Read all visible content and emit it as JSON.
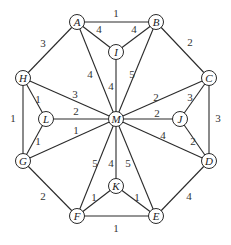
{
  "graph": {
    "nodes": [
      {
        "id": "A",
        "x": 77,
        "y": 22
      },
      {
        "id": "B",
        "x": 156,
        "y": 22
      },
      {
        "id": "C",
        "x": 209,
        "y": 78
      },
      {
        "id": "D",
        "x": 209,
        "y": 161
      },
      {
        "id": "E",
        "x": 156,
        "y": 216
      },
      {
        "id": "F",
        "x": 77,
        "y": 216
      },
      {
        "id": "G",
        "x": 23,
        "y": 161
      },
      {
        "id": "H",
        "x": 23,
        "y": 78
      },
      {
        "id": "I",
        "x": 116,
        "y": 52
      },
      {
        "id": "J",
        "x": 180,
        "y": 119
      },
      {
        "id": "K",
        "x": 116,
        "y": 186
      },
      {
        "id": "L",
        "x": 46,
        "y": 119
      },
      {
        "id": "M",
        "x": 116,
        "y": 119
      }
    ],
    "edges": [
      {
        "from": "A",
        "to": "B",
        "weight": "1",
        "lx": 116,
        "ly": 17
      },
      {
        "from": "B",
        "to": "C",
        "weight": "2",
        "lx": 190,
        "ly": 46
      },
      {
        "from": "C",
        "to": "D",
        "weight": "3",
        "lx": 218,
        "ly": 122
      },
      {
        "from": "D",
        "to": "E",
        "weight": "4",
        "lx": 189,
        "ly": 200
      },
      {
        "from": "E",
        "to": "F",
        "weight": "1",
        "lx": 116,
        "ly": 232
      },
      {
        "from": "F",
        "to": "G",
        "weight": "2",
        "lx": 43,
        "ly": 200
      },
      {
        "from": "G",
        "to": "H",
        "weight": "1",
        "lx": 13,
        "ly": 122
      },
      {
        "from": "H",
        "to": "A",
        "weight": "3",
        "lx": 43,
        "ly": 47
      },
      {
        "from": "A",
        "to": "I",
        "weight": "4",
        "lx": 99,
        "ly": 33
      },
      {
        "from": "B",
        "to": "I",
        "weight": "4",
        "lx": 134,
        "ly": 33
      },
      {
        "from": "I",
        "to": "M",
        "weight": "4",
        "lx": 111,
        "ly": 90
      },
      {
        "from": "A",
        "to": "M",
        "weight": "4",
        "lx": 90,
        "ly": 78
      },
      {
        "from": "B",
        "to": "M",
        "weight": "5",
        "lx": 132,
        "ly": 78
      },
      {
        "from": "H",
        "to": "M",
        "weight": "3",
        "lx": 75,
        "ly": 98
      },
      {
        "from": "L",
        "to": "M",
        "weight": "2",
        "lx": 76,
        "ly": 115
      },
      {
        "from": "G",
        "to": "M",
        "weight": "1",
        "lx": 76,
        "ly": 134
      },
      {
        "from": "H",
        "to": "L",
        "weight": "1",
        "lx": 38,
        "ly": 103
      },
      {
        "from": "L",
        "to": "G",
        "weight": "1",
        "lx": 38,
        "ly": 145
      },
      {
        "from": "C",
        "to": "M",
        "weight": "2",
        "lx": 156,
        "ly": 101
      },
      {
        "from": "J",
        "to": "M",
        "weight": "2",
        "lx": 157,
        "ly": 117
      },
      {
        "from": "D",
        "to": "M",
        "weight": "4",
        "lx": 163,
        "ly": 139
      },
      {
        "from": "C",
        "to": "J",
        "weight": "3",
        "lx": 190,
        "ly": 101
      },
      {
        "from": "J",
        "to": "D",
        "weight": "2",
        "lx": 193,
        "ly": 145
      },
      {
        "from": "F",
        "to": "M",
        "weight": "5",
        "lx": 95,
        "ly": 167
      },
      {
        "from": "K",
        "to": "M",
        "weight": "4",
        "lx": 111,
        "ly": 167
      },
      {
        "from": "E",
        "to": "M",
        "weight": "5",
        "lx": 128,
        "ly": 167
      },
      {
        "from": "F",
        "to": "K",
        "weight": "1",
        "lx": 94,
        "ly": 201
      },
      {
        "from": "K",
        "to": "E",
        "weight": "1",
        "lx": 137,
        "ly": 201
      }
    ]
  }
}
